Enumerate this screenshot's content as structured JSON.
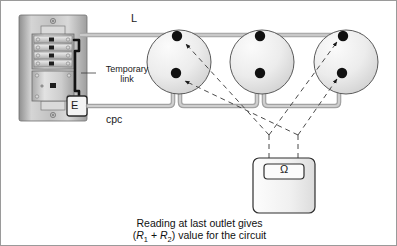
{
  "diagram": {
    "labels": {
      "live_conductor": "L",
      "cpc_conductor": "cpc",
      "temporary_link": "Temporary link",
      "temporary_link_line1": "Temporary",
      "temporary_link_line2": "link",
      "earth_terminal": "E",
      "ohm_symbol": "Ω"
    },
    "caption": {
      "line1": "Reading at last outlet gives",
      "line2_prefix": "(",
      "line2_r1": "R",
      "line2_r1_sub": "1",
      "line2_plus": " + ",
      "line2_r2": "R",
      "line2_r2_sub": "2",
      "line2_suffix": ") value for the circuit",
      "full_text": "Reading at last outlet gives (R1 + R2) value for the circuit"
    },
    "components": {
      "consumer_unit": "consumer-unit",
      "socket_outlet_1": "socket-outlet-1",
      "socket_outlet_2": "socket-outlet-2",
      "socket_outlet_3": "socket-outlet-3",
      "ohmmeter": "ohmmeter",
      "test_probe_left": "test-probe-left",
      "test_probe_right": "test-probe-right"
    },
    "colors": {
      "conductor_grey": "#b9b9b9",
      "conductor_outline": "#8e8e8e",
      "terminal_black": "#111111",
      "panel_face": "#cccccc",
      "panel_dark": "#9b9b9b",
      "socket_fill": "#e9e9e9",
      "outline": "#4d4d4d",
      "dashed_lead": "#555555",
      "background": "#ffffff"
    },
    "counts": {
      "socket_outlets": 3,
      "terminals_per_socket": 2,
      "busbar_rows": 4
    }
  }
}
